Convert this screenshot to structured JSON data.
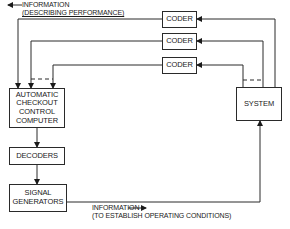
{
  "diagram": {
    "title": "",
    "nodes": {
      "coder_1": {
        "label": "CODER"
      },
      "coder_2": {
        "label": "CODER"
      },
      "coder_3": {
        "label": "CODER"
      },
      "computer": {
        "line1": "AUTOMATIC",
        "line2": "CHECKOUT",
        "line3": "CONTROL",
        "line4": "COMPUTER"
      },
      "decoders": {
        "label": "DECODERS"
      },
      "signal_generators": {
        "line1": "SIGNAL",
        "line2": "GENERATORS"
      },
      "system": {
        "label": "SYSTEM"
      }
    },
    "annotations": {
      "performance": {
        "line1": "INFORMATION",
        "line2": "(DESCRIBING PERFORMANCE)",
        "arrow": "left-arrow"
      },
      "operating": {
        "line1": "INFORMATION",
        "line2": "(TO ESTABLISH OPERATING CONDITIONS)",
        "arrow": "right-arrow"
      }
    },
    "edges": [
      {
        "from": "system",
        "to": "coder_1",
        "style": "solid"
      },
      {
        "from": "system",
        "to": "coder_2",
        "style": "solid"
      },
      {
        "from": "system",
        "to": "coder_3",
        "style": "solid"
      },
      {
        "from": "coder_1",
        "to": "computer",
        "style": "solid"
      },
      {
        "from": "coder_2",
        "to": "computer",
        "style": "solid"
      },
      {
        "from": "coder_3",
        "to": "computer",
        "style": "solid"
      },
      {
        "from": "computer",
        "to": "decoders",
        "style": "solid"
      },
      {
        "from": "decoders",
        "to": "signal_generators",
        "style": "solid"
      },
      {
        "from": "signal_generators",
        "to": "system",
        "style": "solid"
      }
    ],
    "colors": {
      "line": "#2a2a2a",
      "background": "#ffffff"
    }
  }
}
